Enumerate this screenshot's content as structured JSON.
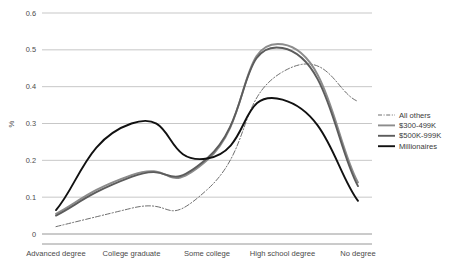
{
  "chart_data": {
    "type": "line",
    "title": "",
    "xlabel": "",
    "ylabel": "%",
    "categories": [
      "Advanced degree",
      "College graduate",
      "Some college",
      "High school degree",
      "No degree"
    ],
    "ylim": [
      0,
      0.6
    ],
    "ytick_labels": [
      "0",
      "0.1",
      "0.2",
      "0.3",
      "0.4",
      "0.5",
      "0.6"
    ],
    "ytick_values": [
      0,
      0.1,
      0.2,
      0.3,
      0.4,
      0.5,
      0.6
    ],
    "grid": true,
    "legend_position": "right",
    "series": [
      {
        "name": "All others",
        "style": "dash-dot",
        "color": "#6f6f6f",
        "width": 1.0,
        "values": [
          0.02,
          0.07,
          0.12,
          0.44,
          0.36
        ]
      },
      {
        "name": "$300-499K",
        "style": "solid",
        "color": "#8c8c8c",
        "width": 1.9,
        "values": [
          0.055,
          0.16,
          0.2,
          0.515,
          0.14
        ]
      },
      {
        "name": "$500K-999K",
        "style": "solid",
        "color": "#5c5c5c",
        "width": 1.9,
        "values": [
          0.05,
          0.155,
          0.205,
          0.505,
          0.13
        ]
      },
      {
        "name": "Millionaires",
        "style": "solid",
        "color": "#111111",
        "width": 1.9,
        "values": [
          0.065,
          0.3,
          0.205,
          0.365,
          0.09
        ]
      }
    ]
  },
  "legend": {
    "items": [
      {
        "label": "All others"
      },
      {
        "label": "$300-499K"
      },
      {
        "label": "$500K-999K"
      },
      {
        "label": "Millionaires"
      }
    ]
  },
  "axes": {
    "y_title": "%",
    "y_labels": [
      "0.6",
      "0.5",
      "0.4",
      "0.3",
      "0.2",
      "0.1",
      "0"
    ],
    "x_labels": [
      "Advanced degree",
      "College graduate",
      "Some college",
      "High school degree",
      "No degree"
    ]
  }
}
